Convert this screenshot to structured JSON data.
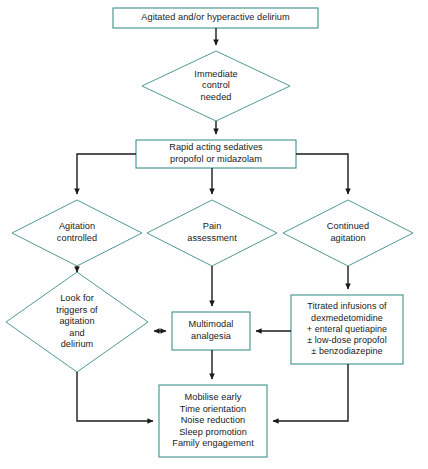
{
  "diagram": {
    "colors": {
      "node_border": "#4f9a94",
      "node_fill": "#ffffff",
      "connector": "#1a1a1a",
      "text": "#1a1a1a",
      "background": "#ffffff"
    },
    "nodes": [
      {
        "id": "start",
        "shape": "rect",
        "label": "Agitated and/or hyperactive delirium"
      },
      {
        "id": "immediate-control",
        "shape": "diamond",
        "label": "Immediate\ncontrol\nneeded"
      },
      {
        "id": "rapid-sedatives",
        "shape": "rect",
        "label": "Rapid acting sedatives\npropofol or midazolam"
      },
      {
        "id": "agitation-controlled",
        "shape": "diamond",
        "label": "Agitation\ncontrolled"
      },
      {
        "id": "pain-assessment",
        "shape": "diamond",
        "label": "Pain\nassessment"
      },
      {
        "id": "continued-agitation",
        "shape": "diamond",
        "label": "Continued\nagitation"
      },
      {
        "id": "look-for-triggers",
        "shape": "diamond",
        "label": "Look for\ntriggers of\nagitation\nand\ndelirium"
      },
      {
        "id": "multimodal-analgesia",
        "shape": "rect",
        "label": "Multimodal\nanalgesia"
      },
      {
        "id": "titrated-infusions",
        "shape": "rect",
        "label": "Titrated infusions of\ndexmedetomidine\n+ enteral quetiapine\n± low-dose propofol\n± benzodiazepine"
      },
      {
        "id": "non-pharmacological",
        "shape": "rect",
        "label": "Mobilise early\nTime orientation\nNoise reduction\nSleep promotion\nFamily engagement"
      }
    ]
  }
}
